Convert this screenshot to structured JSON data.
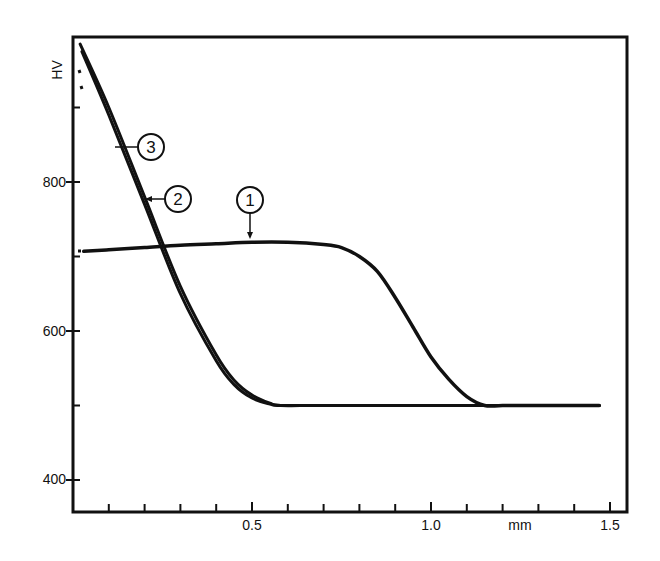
{
  "chart_data": {
    "type": "line",
    "title": "",
    "xlabel": "mm",
    "ylabel": "HV",
    "xlim": [
      0,
      1.57
    ],
    "ylim": [
      355,
      1010
    ],
    "grid": false,
    "legend": "callout labels 1, 2, 3 (circled numerals)",
    "x_ticks": [
      0.5,
      1.0,
      1.5
    ],
    "x_tick_labels": [
      "0.5",
      "1.0",
      "1.5"
    ],
    "x_minor_tick_step": 0.1,
    "y_ticks": [
      400,
      600,
      800
    ],
    "y_tick_labels": [
      "400",
      "600",
      "800"
    ],
    "y_minor_ticks": [
      500,
      700,
      900
    ],
    "series": [
      {
        "name": "1",
        "x": [
          0.03,
          0.1,
          0.2,
          0.3,
          0.4,
          0.5,
          0.6,
          0.7,
          0.75,
          0.8,
          0.85,
          0.9,
          0.95,
          1.0,
          1.05,
          1.1,
          1.15,
          1.2,
          1.3,
          1.4,
          1.47
        ],
        "values": [
          707,
          709,
          712,
          715,
          717,
          719,
          719,
          716,
          712,
          700,
          680,
          645,
          605,
          565,
          535,
          512,
          500,
          500,
          500,
          500,
          500
        ]
      },
      {
        "name": "2",
        "x": [
          0.025,
          0.1,
          0.2,
          0.3,
          0.4,
          0.45,
          0.5,
          0.55,
          0.58,
          0.7,
          1.0,
          1.47
        ],
        "values": [
          975,
          890,
          770,
          650,
          560,
          528,
          510,
          502,
          500,
          500,
          500,
          500
        ]
      },
      {
        "name": "3",
        "x": [
          0.02,
          0.1,
          0.2,
          0.3,
          0.4,
          0.45,
          0.5,
          0.55,
          0.58,
          0.7,
          1.0,
          1.47
        ],
        "values": [
          985,
          900,
          780,
          660,
          568,
          534,
          514,
          503,
          500,
          500,
          500,
          500
        ]
      }
    ],
    "annotations": [
      {
        "label": "1",
        "points_to": {
          "x": 0.5,
          "y": 719
        }
      },
      {
        "label": "2",
        "points_to": {
          "x": 0.19,
          "y": 785
        }
      },
      {
        "label": "3",
        "points_to": {
          "x": 0.12,
          "y": 860
        }
      }
    ]
  },
  "labels": {
    "y_axis": "HV",
    "x_axis_unit": "mm",
    "y_tick_400": "400",
    "y_tick_600": "600",
    "y_tick_800": "800",
    "x_tick_05": "0.5",
    "x_tick_10": "1.0",
    "x_tick_15": "1.5",
    "callout_1": "1",
    "callout_2": "2",
    "callout_3": "3"
  }
}
